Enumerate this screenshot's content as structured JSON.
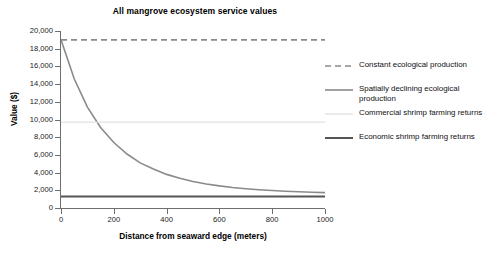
{
  "chart_data": {
    "type": "line",
    "title": "All mangrove ecosystem service values",
    "xlabel": "Distance from seaward edge (meters)",
    "ylabel": "Value ($)",
    "xlim": [
      0,
      1000
    ],
    "ylim": [
      0,
      20000
    ],
    "grid": false,
    "legend_position": "right",
    "x_ticks": [
      "0",
      "200",
      "400",
      "600",
      "800",
      "1000"
    ],
    "x_tick_values": [
      0,
      200,
      400,
      600,
      800,
      1000
    ],
    "y_ticks": [
      "0",
      "2,000",
      "4,000",
      "6,000",
      "8,000",
      "10,000",
      "12,000",
      "14,000",
      "16,000",
      "18,000",
      "20,000"
    ],
    "y_tick_values": [
      0,
      2000,
      4000,
      6000,
      8000,
      10000,
      12000,
      14000,
      16000,
      18000,
      20000
    ],
    "x": [
      0,
      50,
      100,
      150,
      200,
      250,
      300,
      350,
      400,
      450,
      500,
      550,
      600,
      650,
      700,
      750,
      800,
      850,
      900,
      950,
      1000
    ],
    "series": [
      {
        "name": "Constant ecological production",
        "style": "dashed",
        "color": "#8a8a8a",
        "values": [
          19000,
          19000,
          19000,
          19000,
          19000,
          19000,
          19000,
          19000,
          19000,
          19000,
          19000,
          19000,
          19000,
          19000,
          19000,
          19000,
          19000,
          19000,
          19000,
          19000,
          19000
        ]
      },
      {
        "name": "Spatially declining ecological production",
        "style": "solid",
        "color": "#8a8a8a",
        "values": [
          19000,
          14600,
          11400,
          9100,
          7400,
          6100,
          5100,
          4400,
          3800,
          3350,
          3000,
          2720,
          2500,
          2320,
          2180,
          2060,
          1970,
          1890,
          1830,
          1780,
          1740
        ]
      },
      {
        "name": "Commercial shrimp farming returns",
        "style": "solid-light",
        "color": "#e2e2e2",
        "values": [
          9700,
          9700,
          9700,
          9700,
          9700,
          9700,
          9700,
          9700,
          9700,
          9700,
          9700,
          9700,
          9700,
          9700,
          9700,
          9700,
          9700,
          9700,
          9700,
          9700,
          9700
        ]
      },
      {
        "name": "Economic shrimp farming returns",
        "style": "solid-dark",
        "color": "#555555",
        "values": [
          1300,
          1300,
          1300,
          1300,
          1300,
          1300,
          1300,
          1300,
          1300,
          1300,
          1300,
          1300,
          1300,
          1300,
          1300,
          1300,
          1300,
          1300,
          1300,
          1300,
          1300
        ]
      }
    ]
  },
  "legend": {
    "items": [
      {
        "label": "Constant ecological production"
      },
      {
        "label": "Spatially declining ecological production"
      },
      {
        "label": "Commercial shrimp farming returns"
      },
      {
        "label": "Economic shrimp farming returns"
      }
    ]
  }
}
